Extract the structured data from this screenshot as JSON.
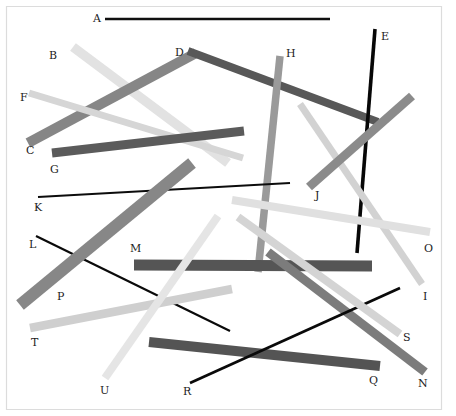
{
  "figure": {
    "title": "",
    "background_color": "#ffffff",
    "border_color": "#d9d9d9",
    "label_color": "#1c1c1c",
    "width": 456,
    "height": 416
  },
  "chart_data": {
    "type": "line",
    "title": "",
    "xlabel": "",
    "ylabel": "",
    "xlim": [
      0,
      456
    ],
    "ylim": [
      0,
      416
    ],
    "grid": false,
    "legend_position": "none",
    "segments": [
      {
        "label": "A",
        "x1": 105,
        "y1": 19,
        "x2": 330,
        "y2": 19,
        "color": "#101010",
        "width": 2.4,
        "label_x": 93,
        "label_y": 13
      },
      {
        "label": "B",
        "x1": 73,
        "y1": 47,
        "x2": 228,
        "y2": 163,
        "color": "#e2e2e2",
        "width": 9.5,
        "label_x": 49,
        "label_y": 50
      },
      {
        "label": "C",
        "x1": 28,
        "y1": 143,
        "x2": 196,
        "y2": 53,
        "color": "#868686",
        "width": 10.0,
        "label_x": 26,
        "label_y": 145
      },
      {
        "label": "D",
        "x1": 188,
        "y1": 51,
        "x2": 378,
        "y2": 122,
        "color": "#585858",
        "width": 8.0,
        "label_x": 175,
        "label_y": 47
      },
      {
        "label": "E",
        "x1": 375,
        "y1": 29,
        "x2": 357,
        "y2": 253,
        "color": "#070707",
        "width": 3.6,
        "label_x": 381,
        "label_y": 31
      },
      {
        "label": "F",
        "x1": 29,
        "y1": 93,
        "x2": 243,
        "y2": 158,
        "color": "#d6d6d6",
        "width": 7.0,
        "label_x": 20,
        "label_y": 92
      },
      {
        "label": "G",
        "x1": 52,
        "y1": 153,
        "x2": 244,
        "y2": 131,
        "color": "#5b5b5b",
        "width": 9.0,
        "label_x": 50,
        "label_y": 164
      },
      {
        "label": "H",
        "x1": 280,
        "y1": 56,
        "x2": 258,
        "y2": 272,
        "color": "#9a9a9a",
        "width": 7.5,
        "label_x": 286,
        "label_y": 48
      },
      {
        "label": "I",
        "x1": 422,
        "y1": 284,
        "x2": 300,
        "y2": 104,
        "color": "#d2d2d2",
        "width": 7.0,
        "label_x": 423,
        "label_y": 291
      },
      {
        "label": "J",
        "x1": 309,
        "y1": 187,
        "x2": 412,
        "y2": 96,
        "color": "#8b8b8b",
        "width": 9.0,
        "label_x": 315,
        "label_y": 190
      },
      {
        "label": "K",
        "x1": 38,
        "y1": 197,
        "x2": 290,
        "y2": 183,
        "color": "#0c0c0c",
        "width": 2.0,
        "label_x": 34,
        "label_y": 202
      },
      {
        "label": "L",
        "x1": 36,
        "y1": 236,
        "x2": 230,
        "y2": 331,
        "color": "#0a0a0a",
        "width": 2.2,
        "label_x": 29,
        "label_y": 239
      },
      {
        "label": "M",
        "x1": 134,
        "y1": 265,
        "x2": 372,
        "y2": 266,
        "color": "#555555",
        "width": 11.0,
        "label_x": 130,
        "label_y": 243
      },
      {
        "label": "N",
        "x1": 425,
        "y1": 372,
        "x2": 268,
        "y2": 252,
        "color": "#7c7c7c",
        "width": 9.0,
        "label_x": 418,
        "label_y": 378
      },
      {
        "label": "O",
        "x1": 430,
        "y1": 232,
        "x2": 232,
        "y2": 200,
        "color": "#e0e0e0",
        "width": 8.0,
        "label_x": 424,
        "label_y": 243
      },
      {
        "label": "P",
        "x1": 20,
        "y1": 305,
        "x2": 192,
        "y2": 163,
        "color": "#878787",
        "width": 12.0,
        "label_x": 57,
        "label_y": 291
      },
      {
        "label": "Q",
        "x1": 149,
        "y1": 342,
        "x2": 380,
        "y2": 366,
        "color": "#545454",
        "width": 10.0,
        "label_x": 369,
        "label_y": 375
      },
      {
        "label": "R",
        "x1": 190,
        "y1": 383,
        "x2": 400,
        "y2": 288,
        "color": "#0a0a0a",
        "width": 2.8,
        "label_x": 183,
        "label_y": 386
      },
      {
        "label": "S",
        "x1": 400,
        "y1": 334,
        "x2": 238,
        "y2": 217,
        "color": "#d4d4d4",
        "width": 8.0,
        "label_x": 403,
        "label_y": 332
      },
      {
        "label": "T",
        "x1": 30,
        "y1": 328,
        "x2": 232,
        "y2": 289,
        "color": "#cfcfcf",
        "width": 8.5,
        "label_x": 31,
        "label_y": 337
      },
      {
        "label": "U",
        "x1": 105,
        "y1": 378,
        "x2": 218,
        "y2": 216,
        "color": "#e5e5e5",
        "width": 8.0,
        "label_x": 100,
        "label_y": 385
      }
    ]
  }
}
